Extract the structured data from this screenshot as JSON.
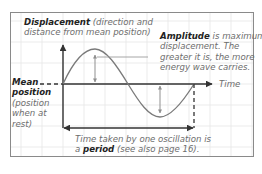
{
  "diagram": {
    "type": "wave-diagram",
    "top_fragments": [
      "y",
      "w h",
      "l"
    ],
    "displacement_label": {
      "bold": "Displacement",
      "rest_line1": " (direction and",
      "line2": "distance from mean position)"
    },
    "amplitude_label": {
      "bold": "Amplitude",
      "rest_line1": " is maximum",
      "line2": "displacement. The",
      "line3": "greater it is, the more",
      "line4": "energy wave carries."
    },
    "time_label": "Time",
    "mean_label": {
      "bold_line1": "Mean",
      "bold_line2": "position",
      "line3": "(position",
      "line4": "when at",
      "line5": "rest)"
    },
    "period_label": {
      "line1": "Time taken by one oscillation is",
      "prefix": "a ",
      "bold": "period",
      "suffix": " (see also page 16)."
    },
    "colors": {
      "frame": "#8a8a8a",
      "grid": "#e6e6e6",
      "axis": "#333333",
      "wave": "#7a7a7a",
      "amplitude_arrow": "#8f8f8f"
    }
  }
}
